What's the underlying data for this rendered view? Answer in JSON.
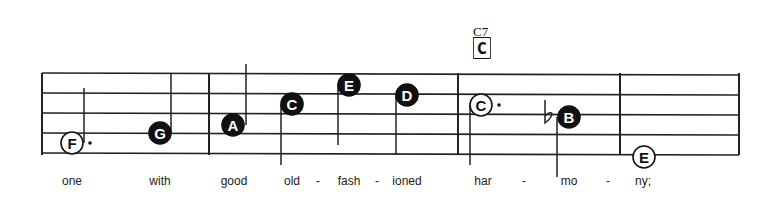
{
  "chord": {
    "name": "C7",
    "box_letter": "C"
  },
  "staff": {
    "left": 42,
    "right": 739,
    "lines_y": [
      73,
      93,
      113,
      133,
      153
    ],
    "barlines_x": [
      42,
      209,
      458,
      620,
      739
    ]
  },
  "notes": [
    {
      "letter": "F",
      "x": 72,
      "y": 143,
      "filled": false,
      "stem": "up",
      "stem_x": 84,
      "stem_end": 88,
      "dotted": true
    },
    {
      "letter": "G",
      "x": 160,
      "y": 133,
      "filled": true,
      "stem": "up",
      "stem_x": 171,
      "stem_end": 74,
      "dotted": false
    },
    {
      "letter": "A",
      "x": 233,
      "y": 125,
      "filled": true,
      "stem": "up",
      "stem_x": 246,
      "stem_end": 64,
      "dotted": false
    },
    {
      "letter": "C",
      "x": 292,
      "y": 104,
      "filled": true,
      "stem": "down",
      "stem_x": 281,
      "stem_end": 165,
      "dotted": false
    },
    {
      "letter": "E",
      "x": 349,
      "y": 85,
      "filled": true,
      "stem": "down",
      "stem_x": 338,
      "stem_end": 145,
      "dotted": false
    },
    {
      "letter": "D",
      "x": 407,
      "y": 95,
      "filled": true,
      "stem": "down",
      "stem_x": 396,
      "stem_end": 155,
      "dotted": false
    },
    {
      "letter": "C",
      "x": 481,
      "y": 105,
      "filled": false,
      "stem": "down",
      "stem_x": 470,
      "stem_end": 165,
      "dotted": true
    },
    {
      "letter": "B",
      "x": 569,
      "y": 117,
      "filled": true,
      "stem": "down",
      "stem_x": 557,
      "stem_end": 177,
      "dotted": false,
      "accidental": "flat"
    },
    {
      "letter": "E",
      "x": 644,
      "y": 157,
      "filled": false,
      "stem": "none",
      "dotted": false
    }
  ],
  "lyrics": [
    {
      "text": "one",
      "x": 72
    },
    {
      "text": "with",
      "x": 160
    },
    {
      "text": "good",
      "x": 234
    },
    {
      "text": "old",
      "x": 292
    },
    {
      "text": "-",
      "x": 318
    },
    {
      "text": "fash",
      "x": 349
    },
    {
      "text": "-",
      "x": 377
    },
    {
      "text": "ioned",
      "x": 407
    },
    {
      "text": "har",
      "x": 483
    },
    {
      "text": "-",
      "x": 524
    },
    {
      "text": "mo",
      "x": 569
    },
    {
      "text": "-",
      "x": 608
    },
    {
      "text": "ny;",
      "x": 643
    }
  ]
}
